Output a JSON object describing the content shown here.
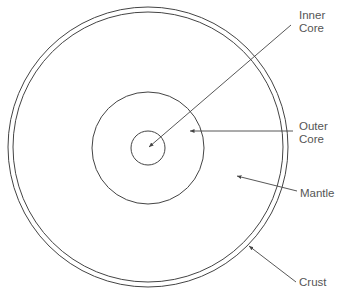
{
  "diagram": {
    "labels": {
      "inner_core": [
        "Inner",
        "Core"
      ],
      "outer_core": [
        "Outer",
        "Core"
      ],
      "mantle": "Mantle",
      "crust": "Crust"
    },
    "colors": {
      "line": "#444444",
      "text": "#555555",
      "background": "#ffffff"
    },
    "geometry": {
      "center": [
        148,
        147
      ],
      "crust_outer_radius": 140,
      "crust_inner_radius": 135,
      "outer_core_radius": 56,
      "inner_core_radius": 17
    }
  }
}
